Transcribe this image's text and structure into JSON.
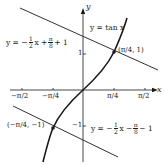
{
  "figure": {
    "axes": {
      "x_label": "x",
      "y_label": "y",
      "x_ticks": [
        "−π/2",
        "−π/4",
        "π/4",
        "π/2"
      ],
      "y_ticks": [
        "1",
        "−1"
      ]
    },
    "curve": {
      "label": "y = tan x"
    },
    "tangent_upper": {
      "lhs": "y = −",
      "frac1_num": "1",
      "frac1_den": "2",
      "mid": "x +",
      "frac2_num": "π",
      "frac2_den": "8",
      "tail": "+ 1"
    },
    "tangent_lower": {
      "lhs": "y = −",
      "frac1_num": "1",
      "frac1_den": "2",
      "mid": "x −",
      "frac2_num": "π",
      "frac2_den": "8",
      "tail": "− 1"
    },
    "points": [
      {
        "label": "(π/4, 1)"
      },
      {
        "label": "(−π/4, −1)"
      }
    ],
    "colors": {
      "ink": "#1a1a1a",
      "background": "#ffffff"
    }
  }
}
